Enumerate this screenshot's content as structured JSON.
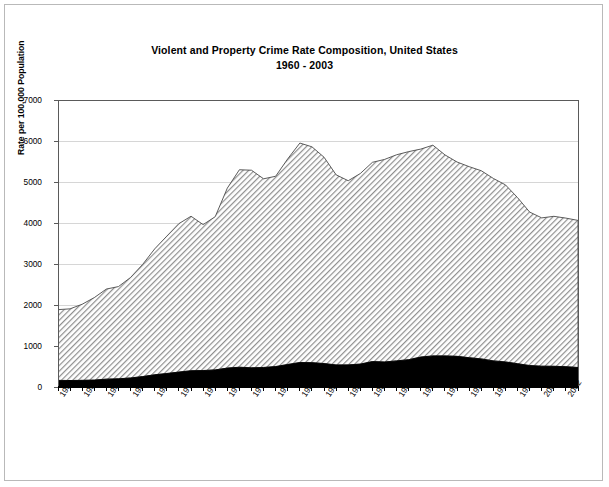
{
  "figure": {
    "title_line1": "Violent and Property Crime Rate Composition, United States",
    "title_line2": "1960 - 2003"
  },
  "chart_data": {
    "type": "area",
    "stacked": true,
    "title": "Violent and Property Crime Rate Composition, United States 1960 - 2003",
    "subtitle": "1960 - 2003",
    "xlabel": "",
    "ylabel": "Rate per 100,000 Population",
    "xlim": [
      1960,
      2003
    ],
    "ylim": [
      0,
      7000
    ],
    "yticks": [
      0,
      1000,
      2000,
      3000,
      4000,
      5000,
      6000,
      7000
    ],
    "ytick_labels": [
      "0",
      "1000",
      "2000",
      "3000",
      "4000",
      "5000",
      "6000",
      "7000"
    ],
    "grid": true,
    "grid_axis": "y",
    "legend": "none",
    "xtick_labels": [
      "1960",
      "1962",
      "1964",
      "1966",
      "1968",
      "1970",
      "1972",
      "1974",
      "1976",
      "1978",
      "1980",
      "1982",
      "1984",
      "1986",
      "1988",
      "1990",
      "1992",
      "1994",
      "1996",
      "1998",
      "2000",
      "2002"
    ],
    "xtick_rotation": -56,
    "x": [
      1960,
      1961,
      1962,
      1963,
      1964,
      1965,
      1966,
      1967,
      1968,
      1969,
      1970,
      1971,
      1972,
      1973,
      1974,
      1975,
      1976,
      1977,
      1978,
      1979,
      1980,
      1981,
      1982,
      1983,
      1984,
      1985,
      1986,
      1987,
      1988,
      1989,
      1990,
      1991,
      1992,
      1993,
      1994,
      1995,
      1996,
      1997,
      1998,
      1999,
      2000,
      2001,
      2002,
      2003
    ],
    "series": [
      {
        "name": "Violent Crime Rate",
        "color": "#000000",
        "fill": "solid-black",
        "values": [
          161,
          158,
          162,
          168,
          191,
          200,
          220,
          254,
          298,
          329,
          364,
          396,
          401,
          417,
          461,
          482,
          468,
          476,
          498,
          549,
          597,
          594,
          571,
          538,
          539,
          558,
          620,
          610,
          637,
          666,
          730,
          758,
          758,
          747,
          714,
          685,
          637,
          611,
          568,
          523,
          507,
          505,
          495,
          475
        ]
      },
      {
        "name": "Property Crime Rate",
        "color": "#a8a8a8",
        "fill": "diagonal-hatch",
        "values": [
          1726,
          1747,
          1857,
          2012,
          2198,
          2249,
          2451,
          2737,
          3071,
          3351,
          3621,
          3769,
          3561,
          3737,
          4389,
          4811,
          4820,
          4602,
          4643,
          5017,
          5353,
          5264,
          5033,
          4637,
          4492,
          4651,
          4863,
          4940,
          5027,
          5078,
          5073,
          5140,
          4903,
          4740,
          4660,
          4591,
          4451,
          4316,
          4052,
          3744,
          3618,
          3658,
          3624,
          3588
        ]
      }
    ],
    "totals": [
      1887,
      1906,
      2019,
      2180,
      2389,
      2449,
      2671,
      2990,
      3370,
      3680,
      3985,
      4165,
      3961,
      4154,
      4850,
      5299,
      5287,
      5078,
      5140,
      5566,
      5950,
      5858,
      5604,
      5175,
      5031,
      5207,
      5480,
      5550,
      5664,
      5741,
      5803,
      5898,
      5661,
      5487,
      5374,
      5275,
      5087,
      4930,
      4620,
      4267,
      4125,
      4163,
      4119,
      4063
    ],
    "note": "Stacked: black = violent crime rate, hatched gray = property crime rate; top of filled area = total crime index rate"
  },
  "axis": {
    "y_title": "Rate per 100,000 Population"
  }
}
